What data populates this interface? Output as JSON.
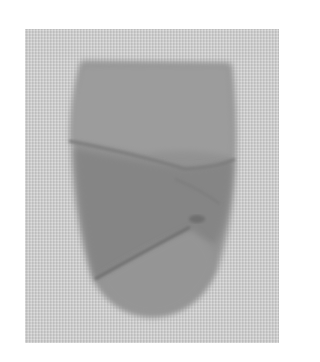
{
  "image": {
    "description": "Grayscale photograph of a folded, rounded piece of material on a textured light-gray background",
    "colors": {
      "background": "#cfcfcf",
      "object_light": "#9a9a9a",
      "object_mid": "#8a8a8a",
      "object_dark": "#6e6e6e",
      "page": "#ffffff"
    }
  }
}
